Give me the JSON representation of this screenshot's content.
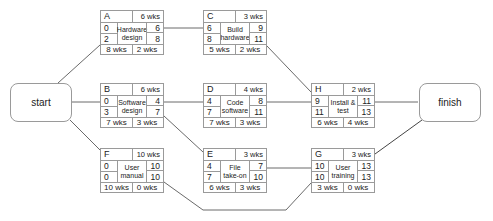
{
  "diagram": {
    "type": "activity-on-node network (critical path)",
    "terminals": {
      "start": {
        "label": "start"
      },
      "finish": {
        "label": "finish"
      }
    },
    "nodes": {
      "A": {
        "id": "A",
        "duration": "6 wks",
        "name_line1": "Hardware",
        "name_line2": "design",
        "es": "0",
        "ls": "2",
        "ef": "6",
        "lf": "8",
        "total": "8 wks",
        "slack": "2 wks"
      },
      "B": {
        "id": "B",
        "duration": "6 wks",
        "name_line1": "Software",
        "name_line2": "design",
        "es": "0",
        "ls": "3",
        "ef": "4",
        "lf": "7",
        "total": "7 wks",
        "slack": "3 wks"
      },
      "C": {
        "id": "C",
        "duration": "3 wks",
        "name_line1": "Build",
        "name_line2": "hardware",
        "es": "6",
        "ls": "8",
        "ef": "9",
        "lf": "11",
        "total": "5 wks",
        "slack": "2 wks"
      },
      "D": {
        "id": "D",
        "duration": "4 wks",
        "name_line1": "Code",
        "name_line2": "software",
        "es": "4",
        "ls": "7",
        "ef": "8",
        "lf": "11",
        "total": "7 wks",
        "slack": "3 wks"
      },
      "E": {
        "id": "E",
        "duration": "3 wks",
        "name_line1": "File",
        "name_line2": "take-on",
        "es": "4",
        "ls": "7",
        "ef": "7",
        "lf": "10",
        "total": "6 wks",
        "slack": "3 wks"
      },
      "F": {
        "id": "F",
        "duration": "10 wks",
        "name_line1": "User",
        "name_line2": "manual",
        "es": "0",
        "ls": "0",
        "ef": "10",
        "lf": "10",
        "total": "10 wks",
        "slack": "0 wks"
      },
      "G": {
        "id": "G",
        "duration": "3 wks",
        "name_line1": "User",
        "name_line2": "training",
        "es": "10",
        "ls": "10",
        "ef": "13",
        "lf": "13",
        "total": "3 wks",
        "slack": "0 wks"
      },
      "H": {
        "id": "H",
        "duration": "2 wks",
        "name_line1": "Install &",
        "name_line2": "test",
        "es": "9",
        "ls": "11",
        "ef": "11",
        "lf": "13",
        "total": "6 wks",
        "slack": "4 wks"
      }
    },
    "edges": [
      [
        "start",
        "A"
      ],
      [
        "start",
        "B"
      ],
      [
        "start",
        "F"
      ],
      [
        "A",
        "C"
      ],
      [
        "B",
        "D"
      ],
      [
        "B",
        "E"
      ],
      [
        "C",
        "H"
      ],
      [
        "D",
        "H"
      ],
      [
        "E",
        "G"
      ],
      [
        "F",
        "G"
      ],
      [
        "H",
        "finish"
      ],
      [
        "G",
        "finish"
      ]
    ],
    "colors": {
      "line": "#555555",
      "border": "#9a9a9a",
      "text": "#222222"
    }
  }
}
